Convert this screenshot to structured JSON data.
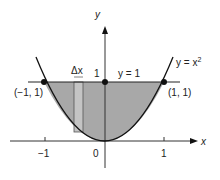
{
  "figure": {
    "curve_label": "y = x",
    "curve_exponent": "2",
    "line_label": "y = 1",
    "x_axis_label": "x",
    "y_axis_label": "y",
    "delta_label": "Δx",
    "y_tick_one": "1",
    "x_ticks": [
      "−1",
      "0",
      "1"
    ],
    "points": [
      {
        "label": "(−1, 1)",
        "x": -1,
        "y": 1
      },
      {
        "label": "(1, 1)",
        "x": 1,
        "y": 1
      },
      {
        "label": "",
        "x": 0,
        "y": 1
      }
    ],
    "colors": {
      "shade": "#a8a8a8",
      "strip": "#c4c4c4",
      "ink": "#1a1a1a"
    }
  }
}
